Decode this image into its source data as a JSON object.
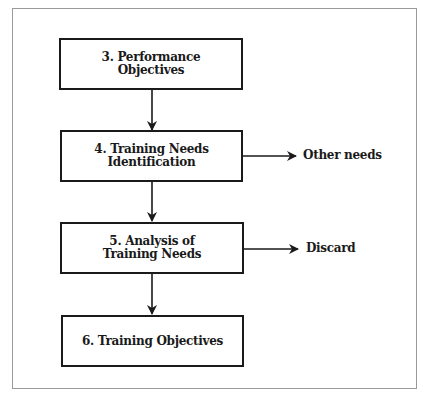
{
  "diagram": {
    "type": "flowchart",
    "nodes": [
      {
        "id": "n3",
        "label": "3. Performance\nObjectives"
      },
      {
        "id": "n4",
        "label": "4. Training Needs\nIdentification"
      },
      {
        "id": "n5",
        "label": "5. Analysis of\nTraining Needs"
      },
      {
        "id": "n6",
        "label": "6. Training Objectives"
      }
    ],
    "side_outputs": [
      {
        "from": "n4",
        "label": "Other needs"
      },
      {
        "from": "n5",
        "label": "Discard"
      }
    ],
    "edges": [
      {
        "from": "n3",
        "to": "n4"
      },
      {
        "from": "n4",
        "to": "n5"
      },
      {
        "from": "n5",
        "to": "n6"
      },
      {
        "from": "n4",
        "to": "Other needs"
      },
      {
        "from": "n5",
        "to": "Discard"
      }
    ],
    "colors": {
      "stroke": "#1a1a1a",
      "frame": "#9a9a9a",
      "background": "#ffffff"
    }
  }
}
